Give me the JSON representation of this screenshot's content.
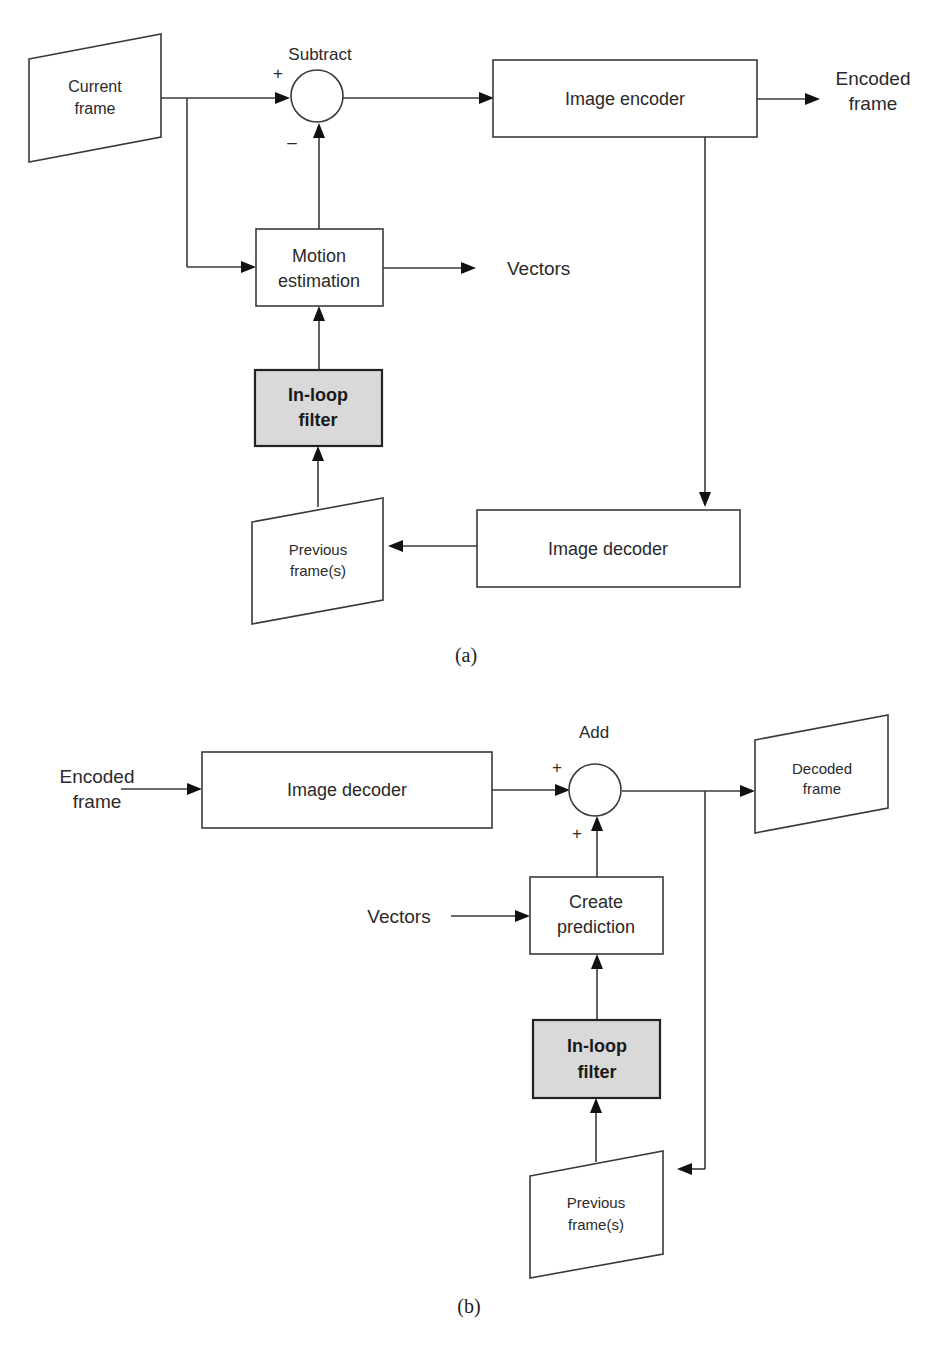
{
  "diagram_a": {
    "caption": "(a)",
    "current_frame": [
      "Current",
      "frame"
    ],
    "subtract_label": "Subtract",
    "plus_sign": "+",
    "minus_sign": "–",
    "image_encoder": "Image encoder",
    "encoded_frame_out": [
      "Encoded",
      "frame"
    ],
    "motion_estimation": [
      "Motion",
      "estimation"
    ],
    "vectors_out": "Vectors",
    "inloop_filter": [
      "In-loop",
      "filter"
    ],
    "previous_frames": [
      "Previous",
      "frame(s)"
    ],
    "image_decoder": "Image decoder"
  },
  "diagram_b": {
    "caption": "(b)",
    "encoded_frame_in": [
      "Encoded",
      "frame"
    ],
    "image_decoder": "Image decoder",
    "add_label": "Add",
    "plus_top": "+",
    "plus_bottom": "+",
    "decoded_frame": [
      "Decoded",
      "frame"
    ],
    "vectors_in": "Vectors",
    "create_prediction": [
      "Create",
      "prediction"
    ],
    "inloop_filter": [
      "In-loop",
      "filter"
    ],
    "previous_frames": [
      "Previous",
      "frame(s)"
    ]
  },
  "colors": {
    "line": "#3a3a3a",
    "filter_fill": "#d9d9d9",
    "background": "#ffffff"
  }
}
